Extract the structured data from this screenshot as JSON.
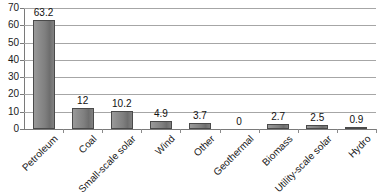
{
  "chart_data": {
    "type": "bar",
    "title": "",
    "xlabel": "",
    "ylabel": "",
    "ylim": [
      0,
      70
    ],
    "ytick_step": 10,
    "yticks": [
      0,
      10,
      20,
      30,
      40,
      50,
      60,
      70
    ],
    "grid": "horizontal",
    "legend": "none",
    "show_data_labels": true,
    "categories": [
      "Petroleum",
      "Coal",
      "Small-scale solar",
      "Wind",
      "Other",
      "Geothermal",
      "Biomass",
      "Utility-scale solar",
      "Hydro"
    ],
    "values": [
      63.2,
      12,
      10.2,
      4.9,
      3.7,
      0,
      2.7,
      2.5,
      0.9
    ],
    "value_labels": [
      "63.2",
      "12",
      "10.2",
      "4.9",
      "3.7",
      "0",
      "2.7",
      "2.5",
      "0.9"
    ],
    "series": [
      {
        "name": "",
        "values": [
          63.2,
          12,
          10.2,
          4.9,
          3.7,
          0,
          2.7,
          2.5,
          0.9
        ]
      }
    ]
  },
  "colors": {
    "bar_fill_light": "#9a9a9a",
    "bar_fill_dark": "#6e6e6e",
    "bar_border": "#4a4a4a",
    "gridline": "#a6a6a6",
    "axis": "#7a7a7a",
    "text": "#1a1a1a",
    "background": "#ffffff"
  }
}
